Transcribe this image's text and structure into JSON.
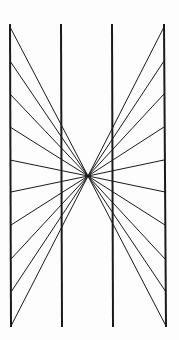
{
  "figure": {
    "type": "hering-illusion",
    "background": "#fdfdfd",
    "stroke": "#1a1a1a",
    "center": {
      "x": 88,
      "y": 176
    },
    "vertical_lines": [
      {
        "x1": 10,
        "y1": 24,
        "x2": 11,
        "y2": 327
      },
      {
        "x1": 61,
        "y1": 24,
        "x2": 62,
        "y2": 327
      },
      {
        "x1": 112,
        "y1": 24,
        "x2": 113,
        "y2": 327
      },
      {
        "x1": 164,
        "y1": 24,
        "x2": 166,
        "y2": 327
      }
    ],
    "ray_endpoints_left": [
      {
        "x": 10,
        "y": 27
      },
      {
        "x": 10,
        "y": 61
      },
      {
        "x": 10,
        "y": 94
      },
      {
        "x": 10,
        "y": 127
      },
      {
        "x": 10,
        "y": 160
      },
      {
        "x": 11,
        "y": 192
      },
      {
        "x": 11,
        "y": 225
      },
      {
        "x": 11,
        "y": 259
      },
      {
        "x": 11,
        "y": 292
      },
      {
        "x": 11,
        "y": 326
      }
    ],
    "ray_endpoints_right": [
      {
        "x": 164,
        "y": 27
      },
      {
        "x": 164,
        "y": 61
      },
      {
        "x": 164,
        "y": 94
      },
      {
        "x": 164,
        "y": 127
      },
      {
        "x": 164,
        "y": 160
      },
      {
        "x": 165,
        "y": 192
      },
      {
        "x": 165,
        "y": 225
      },
      {
        "x": 165,
        "y": 259
      },
      {
        "x": 166,
        "y": 292
      },
      {
        "x": 166,
        "y": 326
      }
    ]
  }
}
